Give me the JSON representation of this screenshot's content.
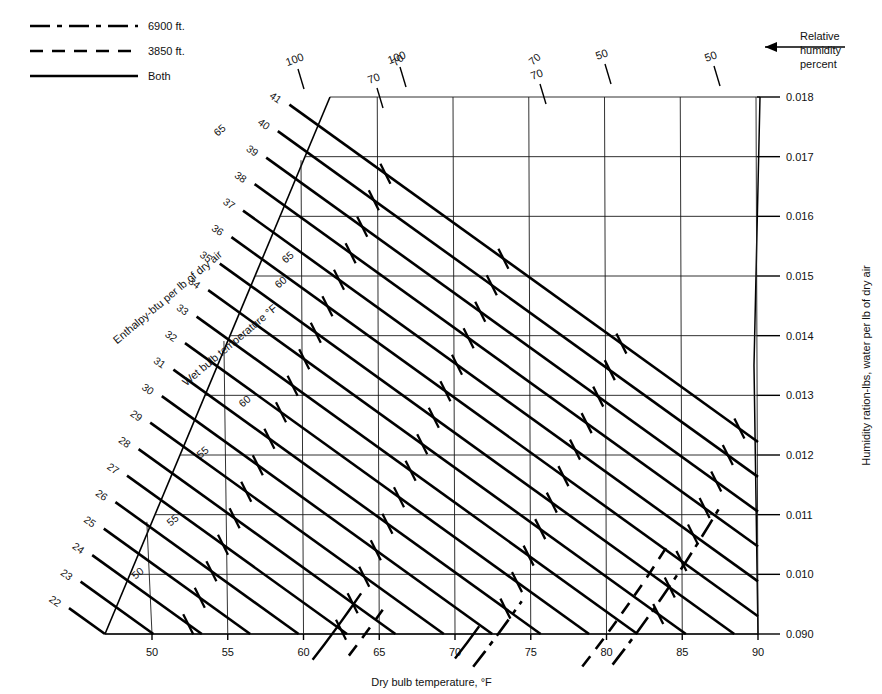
{
  "chart_data": {
    "type": "line",
    "xlabel": "Dry bulb temperature, °F",
    "ylabel": "Humidity ration-lbs, water per lb of dry air",
    "xlim": [
      45.5,
      90
    ],
    "ylim": [
      0.009,
      0.018
    ],
    "grid": true,
    "x_ticks": [
      50,
      55,
      60,
      65,
      70,
      75,
      80,
      85,
      90
    ],
    "y_ticks": [
      "0.090",
      "0.010",
      "0.011",
      "0.012",
      "0.013",
      "0.014",
      "0.015",
      "0.016",
      "0.017",
      "0.018"
    ],
    "y_tick_values": [
      0.009,
      0.01,
      0.011,
      0.012,
      0.013,
      0.014,
      0.015,
      0.016,
      0.017,
      0.018
    ],
    "axis_note": "Relative humidity percent",
    "enthalpy_label": "Enthalpy-btu per lb of dry air",
    "wetbulb_label": "Wet bulb temperature °F",
    "enthalpy_lines": [
      22,
      23,
      24,
      25,
      26,
      27,
      28,
      29,
      30,
      31,
      32,
      33,
      34,
      35,
      36,
      37,
      38,
      39,
      40,
      41
    ],
    "wetbulb_lines": [
      50,
      55,
      60,
      65,
      70
    ],
    "rh_curves": [
      {
        "label": "100",
        "style": "both",
        "rh": 100
      },
      {
        "label": "100",
        "style": "3850",
        "rh": 100
      },
      {
        "label": "70",
        "style": "both",
        "rh": 70
      },
      {
        "label": "70",
        "style": "6900",
        "rh": 70
      },
      {
        "label": "50",
        "style": "3850",
        "rh": 50
      },
      {
        "label": "50",
        "style": "6900",
        "rh": 50
      }
    ],
    "legend": {
      "position": "top-left",
      "entries": [
        {
          "label": "6900 ft.",
          "style": "dash-dot"
        },
        {
          "label": "3850 ft.",
          "style": "dashed"
        },
        {
          "label": "Both",
          "style": "solid"
        }
      ]
    }
  },
  "legend": {
    "items": [
      {
        "label": "6900 ft."
      },
      {
        "label": "3850 ft."
      },
      {
        "label": "Both"
      }
    ]
  },
  "annotations": {
    "rh_note_line1": "Relative",
    "rh_note_line2": "humidity",
    "rh_note_line3": "percent"
  },
  "axes": {
    "x_title": "Dry bulb temperature, °F",
    "y_title": "Humidity ration-lbs, water per lb of dry air",
    "enthalpy_title": "Enthalpy-btu per lb of dry air",
    "wetbulb_title": "Wet bulb temperature °F",
    "x_tick_labels": [
      "50",
      "55",
      "60",
      "65",
      "70",
      "75",
      "80",
      "85",
      "90"
    ],
    "y_tick_labels": [
      "0.018",
      "0.017",
      "0.016",
      "0.015",
      "0.014",
      "0.013",
      "0.012",
      "0.011",
      "0.010",
      "0.090"
    ]
  },
  "enthalpy_labels": [
    "22",
    "23",
    "24",
    "25",
    "26",
    "27",
    "28",
    "29",
    "30",
    "31",
    "32",
    "33",
    "34",
    "35",
    "36",
    "37",
    "38",
    "39",
    "40",
    "41"
  ],
  "wetbulb_labels": [
    "50",
    "55",
    "60",
    "65",
    "70"
  ],
  "rh_labels": [
    "100",
    "100",
    "70",
    "70",
    "50",
    "50"
  ]
}
